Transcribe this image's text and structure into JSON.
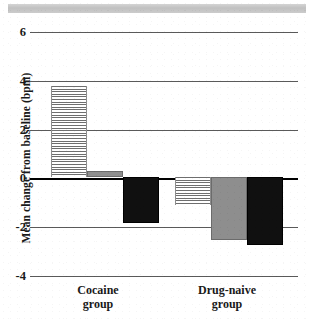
{
  "chart_data": {
    "type": "bar",
    "title": "",
    "subtitle": "",
    "xlabel": "",
    "ylabel": "Mean change from baseline (bpm)",
    "ylim": [
      -4,
      6
    ],
    "yticks": [
      6,
      4,
      2,
      0,
      -2,
      -4
    ],
    "ytick_labels": [
      "6",
      "4",
      "2",
      "0",
      "-2",
      "-4"
    ],
    "grid": true,
    "legend": "none",
    "zero_line": 0,
    "categories": [
      "Cocaine group",
      "Drug-naive group"
    ],
    "category_labels": [
      {
        "line1": "Cocaine",
        "line2": "group"
      },
      {
        "line1": "Drug-naive",
        "line2": "group"
      }
    ],
    "series": [
      {
        "name": "hatched",
        "style": "horizontal-hatch",
        "color": "#6e6e6e",
        "values": [
          3.6,
          -1.1
        ]
      },
      {
        "name": "gray",
        "style": "solid",
        "color": "#8e8e8e",
        "values": [
          0.25,
          -2.5
        ]
      },
      {
        "name": "black",
        "style": "solid",
        "color": "#101010",
        "values": [
          -1.8,
          -2.7
        ]
      }
    ]
  },
  "axis": {
    "tick_6": "6",
    "tick_4": "4",
    "tick_2": "2",
    "tick_0": "0",
    "tick_neg2": "-2",
    "tick_neg4": "-4",
    "y_title": "Mean change from baseline (bpm)"
  },
  "groups": {
    "cocaine_line1": "Cocaine",
    "cocaine_line2": "group",
    "naive_line1": "Drug-naive",
    "naive_line2": "group"
  },
  "colors": {
    "hatch": "#6e6e6e",
    "gray": "#8e8e8e",
    "black": "#101010",
    "axis": "#5a5a5a",
    "zero": "#000000",
    "background": "#ffffff"
  }
}
